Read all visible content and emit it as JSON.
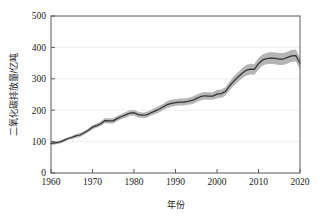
{
  "chart_data": {
    "type": "line",
    "title": "",
    "xlabel": "年份",
    "ylabel": "二氧化碳排放量/亿吨",
    "xlim": [
      1960,
      2020
    ],
    "ylim": [
      0,
      500
    ],
    "xticks": [
      1960,
      1970,
      1980,
      1990,
      2000,
      2010,
      2020
    ],
    "xtick_labels": [
      "1960",
      "1970",
      "1980",
      "1990",
      "2000",
      "2010",
      "2020"
    ],
    "yticks": [
      0,
      100,
      200,
      300,
      400,
      500
    ],
    "ytick_labels": [
      "0",
      "100",
      "200",
      "300",
      "400",
      "500"
    ],
    "grid": "horizontal-faint",
    "legend": "none",
    "line_color": "#333333",
    "band_color": "#a8a8a8",
    "band_label": "不确定性区间",
    "x": [
      1960,
      1961,
      1962,
      1963,
      1964,
      1965,
      1966,
      1967,
      1968,
      1969,
      1970,
      1971,
      1972,
      1973,
      1974,
      1975,
      1976,
      1977,
      1978,
      1979,
      1980,
      1981,
      1982,
      1983,
      1984,
      1985,
      1986,
      1987,
      1988,
      1989,
      1990,
      1991,
      1992,
      1993,
      1994,
      1995,
      1996,
      1997,
      1998,
      1999,
      2000,
      2001,
      2002,
      2003,
      2004,
      2005,
      2006,
      2007,
      2008,
      2009,
      2010,
      2011,
      2012,
      2013,
      2014,
      2015,
      2016,
      2017,
      2018,
      2019,
      2020
    ],
    "series": [
      {
        "name": "二氧化碳排放量",
        "values": [
          94,
          96,
          98,
          103,
          109,
          113,
          118,
          121,
          128,
          136,
          146,
          151,
          157,
          167,
          166,
          166,
          174,
          180,
          185,
          191,
          192,
          186,
          184,
          185,
          191,
          197,
          203,
          210,
          218,
          222,
          224,
          226,
          226,
          228,
          231,
          237,
          243,
          246,
          245,
          245,
          251,
          253,
          259,
          277,
          292,
          305,
          317,
          327,
          331,
          330,
          348,
          360,
          364,
          366,
          365,
          363,
          363,
          368,
          373,
          374,
          350
        ]
      },
      {
        "name": "上界",
        "values": [
          99,
          101,
          103,
          108,
          114,
          118,
          124,
          127,
          134,
          142,
          153,
          158,
          164,
          175,
          174,
          174,
          182,
          188,
          194,
          200,
          201,
          195,
          193,
          194,
          200,
          207,
          213,
          220,
          229,
          233,
          235,
          237,
          237,
          239,
          243,
          249,
          255,
          258,
          257,
          257,
          264,
          266,
          272,
          291,
          307,
          320,
          333,
          344,
          348,
          347,
          366,
          378,
          382,
          385,
          384,
          382,
          382,
          387,
          392,
          393,
          368
        ]
      },
      {
        "name": "下界",
        "values": [
          89,
          91,
          93,
          98,
          104,
          108,
          112,
          115,
          122,
          130,
          139,
          144,
          150,
          159,
          158,
          158,
          166,
          172,
          176,
          182,
          183,
          177,
          175,
          176,
          182,
          187,
          193,
          200,
          207,
          211,
          213,
          215,
          215,
          217,
          219,
          225,
          231,
          234,
          233,
          233,
          238,
          240,
          246,
          263,
          277,
          290,
          301,
          310,
          314,
          313,
          330,
          342,
          346,
          347,
          346,
          344,
          344,
          349,
          354,
          355,
          332
        ]
      }
    ]
  },
  "axis": {
    "y_title": "二氧化碳排放量/亿吨",
    "x_title": "年份"
  }
}
